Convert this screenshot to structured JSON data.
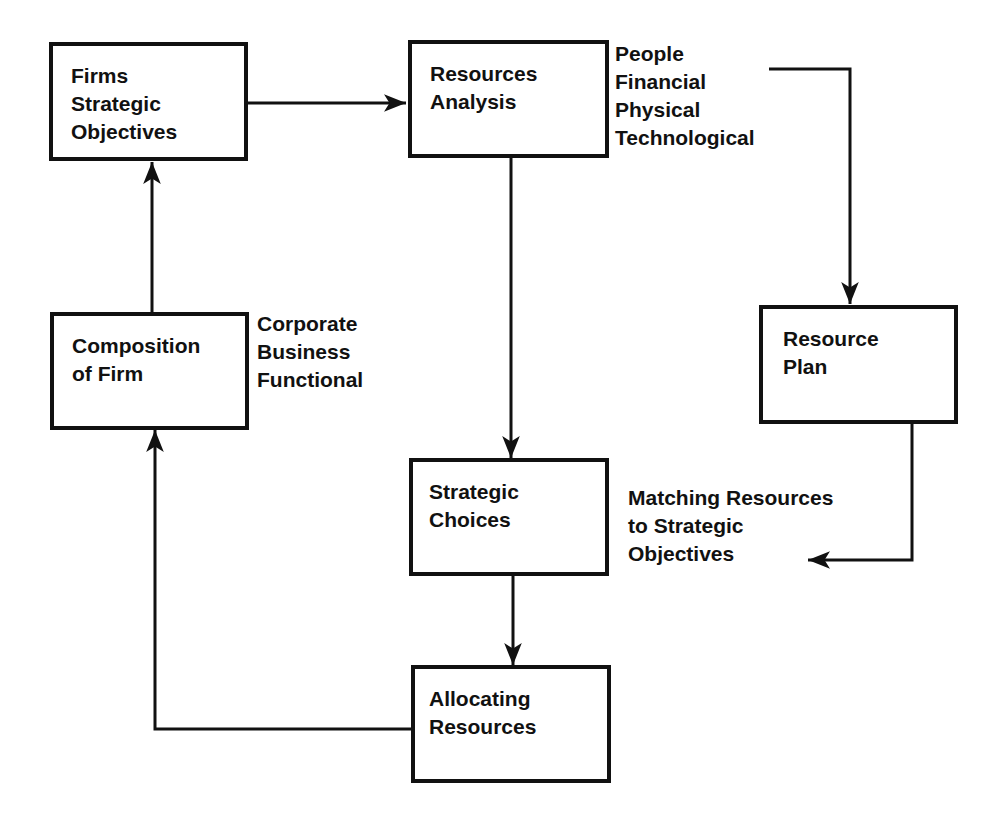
{
  "diagram": {
    "nodes": {
      "objectives": {
        "lines": [
          "Firms",
          "Strategic",
          "Objectives"
        ]
      },
      "resources_analysis": {
        "lines": [
          "Resources",
          "Analysis"
        ]
      },
      "composition": {
        "lines": [
          "Composition",
          "of Firm"
        ]
      },
      "resource_plan": {
        "lines": [
          "Resource",
          "Plan"
        ]
      },
      "strategic_choices": {
        "lines": [
          "Strategic",
          "Choices"
        ]
      },
      "allocating": {
        "lines": [
          "Allocating",
          "Resources"
        ]
      }
    },
    "annotations": {
      "resource_types": [
        "People",
        "Financial",
        "Physical",
        "Technological"
      ],
      "composition_levels": [
        "Corporate",
        "Business",
        "Functional"
      ],
      "matching": [
        "Matching Resources",
        "to Strategic",
        "Objectives"
      ]
    },
    "edges": [
      {
        "from": "objectives",
        "to": "resources_analysis",
        "type": "arrow"
      },
      {
        "from": "objectives",
        "to": "composition",
        "type": "bidirectional"
      },
      {
        "from": "resources_analysis",
        "to": "strategic_choices",
        "type": "arrow"
      },
      {
        "from": "resource_types",
        "to": "resource_plan",
        "type": "arrow"
      },
      {
        "from": "resource_plan",
        "to": "matching",
        "type": "arrow"
      },
      {
        "from": "strategic_choices",
        "to": "allocating",
        "type": "arrow"
      },
      {
        "from": "allocating",
        "to": "composition",
        "type": "arrow"
      }
    ]
  }
}
